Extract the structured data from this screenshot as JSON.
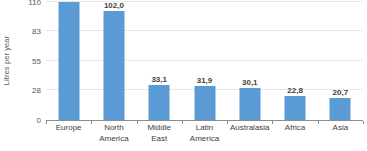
{
  "chart_data": {
    "type": "bar",
    "title": "",
    "subtitle": "",
    "xlabel": "",
    "ylabel": "Litres per year",
    "categories": [
      "Europe",
      "North America",
      "Middle East",
      "Latin America",
      "Australasia",
      "Africa",
      "Asia"
    ],
    "category_lines": [
      [
        "Europe",
        ""
      ],
      [
        "North",
        "America"
      ],
      [
        "Middle",
        "East"
      ],
      [
        "Latin",
        "America"
      ],
      [
        "Australasia",
        ""
      ],
      [
        "Africa",
        ""
      ],
      [
        "Asia",
        ""
      ]
    ],
    "values": [
      109.9,
      102.0,
      33.1,
      31.9,
      30.1,
      22.8,
      20.7
    ],
    "value_labels": [
      "109,9",
      "102,0",
      "33,1",
      "31,9",
      "30,1",
      "22,8",
      "20,7"
    ],
    "ylim": [
      0,
      110
    ],
    "yticks": [
      0,
      28,
      55,
      83,
      110
    ],
    "ytick_labels": [
      "0",
      "28",
      "55",
      "83",
      "110"
    ],
    "grid": true,
    "legend": false,
    "legend_position": "none",
    "decimal_separator": ",",
    "colors": {
      "bar": "#5b9bd5",
      "gridline": "#e8e8e8",
      "axis_line": "#8c8c8c",
      "tick_text": "#595959",
      "category_text": "#404040",
      "value_text": "#3f3f3f",
      "background": "#ffffff"
    }
  }
}
